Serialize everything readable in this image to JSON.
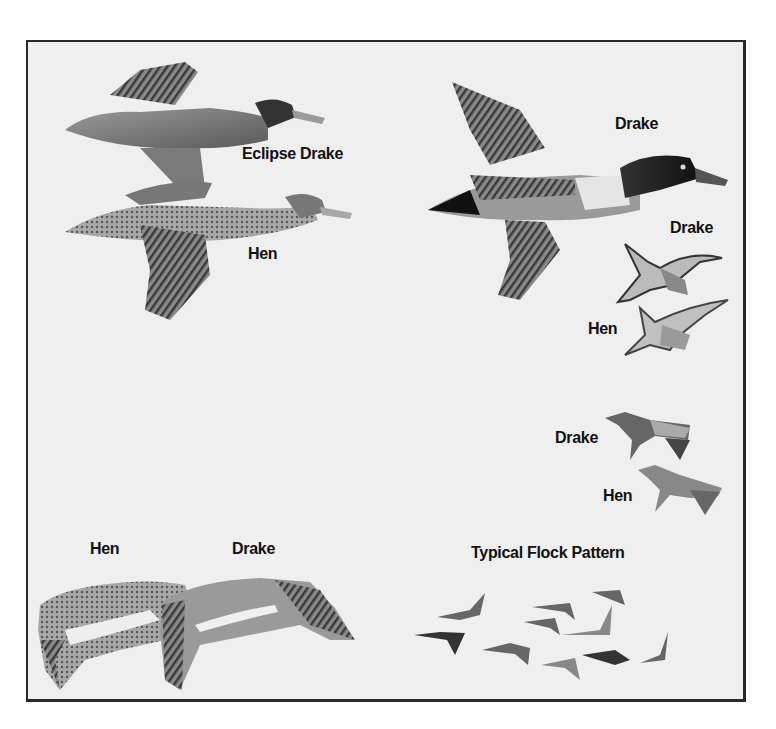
{
  "plate": {
    "background": "#efefef",
    "border_color": "#2a2a2a",
    "labels": {
      "eclipse_drake": "Eclipse Drake",
      "upper_left_hen": "Hen",
      "large_drake": "Drake",
      "overhead_drake": "Drake",
      "overhead_hen": "Hen",
      "side_drake": "Drake",
      "side_hen": "Hen",
      "wing_hen": "Hen",
      "wing_drake": "Drake",
      "flock_title": "Typical Flock Pattern"
    }
  },
  "illustrations": [
    {
      "id": "eclipse-drake-flying",
      "subject": "duck",
      "view": "side"
    },
    {
      "id": "hen-flying",
      "subject": "duck",
      "view": "side"
    },
    {
      "id": "drake-large-flying",
      "subject": "duck",
      "view": "side"
    },
    {
      "id": "drake-overhead",
      "subject": "duck",
      "view": "underside"
    },
    {
      "id": "hen-overhead",
      "subject": "duck",
      "view": "underside"
    },
    {
      "id": "drake-small-side",
      "subject": "duck",
      "view": "side"
    },
    {
      "id": "hen-small-side",
      "subject": "duck",
      "view": "side"
    },
    {
      "id": "hen-wing",
      "subject": "wing"
    },
    {
      "id": "drake-wing",
      "subject": "wing"
    },
    {
      "id": "flock-pattern",
      "subject": "flock",
      "count": 10
    }
  ]
}
